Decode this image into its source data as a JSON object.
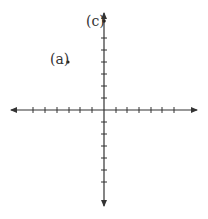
{
  "diagram": {
    "type": "coordinate-plane",
    "colors": {
      "axis": "#333333",
      "background": "#ffffff",
      "point": "#222222"
    },
    "x_axis": {
      "ticks_negative": 6,
      "ticks_positive": 6,
      "arrows": "both"
    },
    "y_axis": {
      "ticks_negative": 6,
      "ticks_positive": 6,
      "arrows": "both"
    },
    "points": [
      {
        "label": "(a)",
        "x": -3,
        "y": 4
      },
      {
        "label": "(c)",
        "x": 0,
        "y": 7.5
      }
    ]
  }
}
